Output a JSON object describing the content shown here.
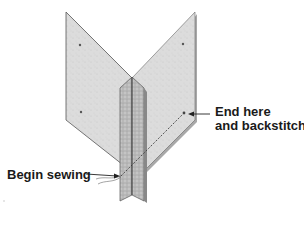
{
  "diagram": {
    "labels": {
      "begin": "Begin sewing",
      "end_line1": "End here",
      "end_line2": "and backstitch"
    },
    "colors": {
      "panel_fill": "#dcdcdc",
      "panel_edge": "#555555",
      "shadow": "#9a9a9a",
      "seam_fill": "#b5b5b5",
      "stitch": "#333333",
      "text": "#1a1a1a"
    }
  }
}
